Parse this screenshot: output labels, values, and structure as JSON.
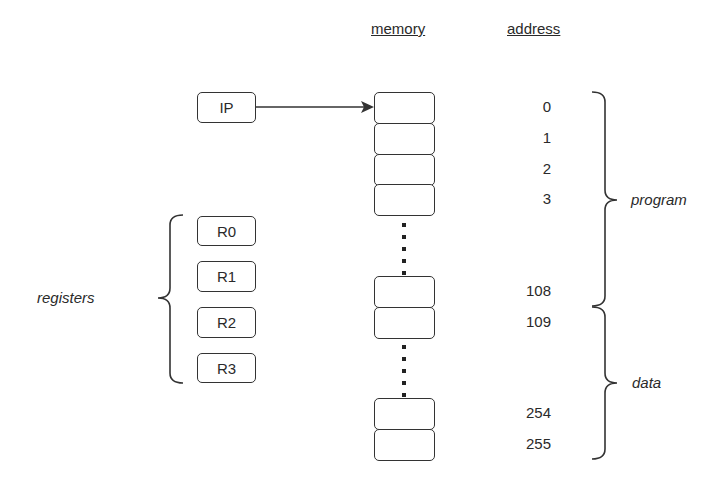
{
  "headers": {
    "memory": "memory",
    "address": "address"
  },
  "ip": {
    "label": "IP"
  },
  "registers": {
    "group_label": "registers",
    "items": [
      {
        "label": "R0"
      },
      {
        "label": "R1"
      },
      {
        "label": "R2"
      },
      {
        "label": "R3"
      }
    ]
  },
  "memory_cells": [
    {
      "address": "0"
    },
    {
      "address": "1"
    },
    {
      "address": "2"
    },
    {
      "address": "3"
    },
    {
      "address": "108"
    },
    {
      "address": "109"
    },
    {
      "address": "254"
    },
    {
      "address": "255"
    }
  ],
  "segments": {
    "program": "program",
    "data": "data"
  }
}
